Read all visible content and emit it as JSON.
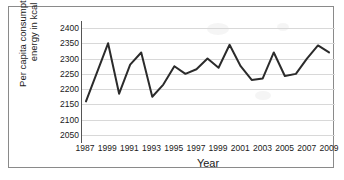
{
  "chart_data": {
    "type": "line",
    "title": "",
    "xlabel": "Year",
    "ylabel": "Per capita consumption of energy in kcal",
    "ylabel_line1": "Per capita consumption of",
    "ylabel_line2": "energy in kcal",
    "ylim": [
      2050,
      2400
    ],
    "ytick_labels": [
      "2400",
      "2350",
      "2300",
      "2250",
      "2200",
      "2150",
      "2100",
      "2050"
    ],
    "ytick_values": [
      2400,
      2350,
      2300,
      2250,
      2200,
      2150,
      2100,
      2050
    ],
    "xtick_labels": [
      "1987",
      "1999",
      "1991",
      "1993",
      "1995",
      "1997",
      "1999",
      "2001",
      "2003",
      "2005",
      "2007",
      "2009"
    ],
    "xtick_values": [
      1987,
      1989,
      1991,
      1993,
      1995,
      1997,
      1999,
      2001,
      2003,
      2005,
      2007,
      2009
    ],
    "xlim": [
      1987,
      2009
    ],
    "grid": true,
    "legend": false,
    "legend_position": "none",
    "line_color": "#2b2b2b",
    "line_width": 2,
    "x": [
      1987,
      1988,
      1989,
      1990,
      1991,
      1992,
      1993,
      1994,
      1995,
      1996,
      1997,
      1998,
      1999,
      2000,
      2001,
      2002,
      2003,
      2004,
      2005,
      2006,
      2007,
      2008,
      2009
    ],
    "values": [
      2160,
      2255,
      2350,
      2185,
      2280,
      2320,
      2175,
      2215,
      2275,
      2250,
      2265,
      2300,
      2270,
      2345,
      2275,
      2230,
      2235,
      2320,
      2243,
      2250,
      2300,
      2343,
      2320
    ],
    "categories": [
      "1987",
      "1988",
      "1989",
      "1990",
      "1991",
      "1992",
      "1993",
      "1994",
      "1995",
      "1996",
      "1997",
      "1998",
      "1999",
      "2000",
      "2001",
      "2002",
      "2003",
      "2004",
      "2005",
      "2006",
      "2007",
      "2008",
      "2009"
    ]
  }
}
